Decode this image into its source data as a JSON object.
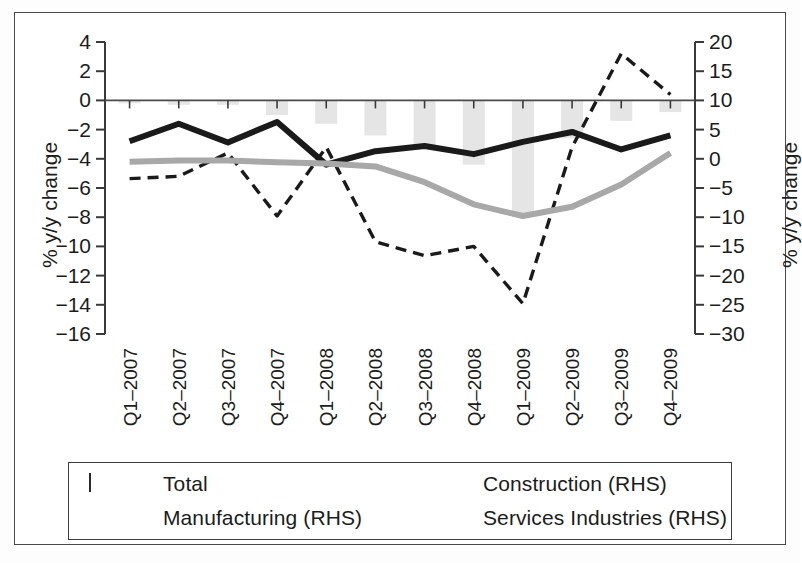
{
  "figure": {
    "left_axis_title": "% y/y change",
    "right_axis_title": "% y/y change"
  },
  "legend": {
    "entries": [
      {
        "label": "Total",
        "marker": "bar-swatch",
        "color": "#e2e2e2"
      },
      {
        "label": "Construction (RHS)",
        "marker": "solid-line",
        "color": "#1a1a1a"
      },
      {
        "label": "Manufacturing (RHS)",
        "marker": "dashed-line",
        "color": "#1a1a1a"
      },
      {
        "label": "Services Industries (RHS)",
        "marker": "gray-line",
        "color": "#a8a8a8"
      }
    ]
  },
  "chart_data": {
    "type": "line",
    "title": "",
    "xlabel": "",
    "ylabel": "% y/y change",
    "y2label": "% y/y change",
    "grid": false,
    "legend_position": "bottom",
    "categories": [
      "Q1-2007",
      "Q2-2007",
      "Q3-2007",
      "Q4-2007",
      "Q1-2008",
      "Q2-2008",
      "Q3-2008",
      "Q4-2008",
      "Q1-2009",
      "Q2-2009",
      "Q3-2009",
      "Q4-2009"
    ],
    "ylim": [
      -16,
      4
    ],
    "yticks": [
      4,
      2,
      0,
      -2,
      -4,
      -6,
      -8,
      -10,
      -12,
      -14,
      -16
    ],
    "ytick_labels": [
      "4",
      "2",
      "0",
      "-2",
      "-4",
      "-6",
      "-8",
      "-10",
      "-12",
      "-14",
      "-16"
    ],
    "y2lim": [
      -30,
      20
    ],
    "y2ticks": [
      20,
      15,
      10,
      5,
      0,
      -5,
      -10,
      -15,
      -20,
      -25,
      -30
    ],
    "y2tick_labels": [
      "20",
      "15",
      "10",
      "5",
      "0",
      "-5",
      "-10",
      "-15",
      "-20",
      "-25",
      "-30"
    ],
    "series": [
      {
        "name": "Total",
        "axis": "left",
        "type": "bar",
        "color": "#e5e5e5",
        "values": [
          -0.2,
          -0.3,
          -0.3,
          -1.0,
          -1.6,
          -2.4,
          -3.2,
          -4.4,
          -8.0,
          -2.6,
          -1.4,
          -0.8
        ]
      },
      {
        "name": "Construction (RHS)",
        "axis": "right",
        "type": "line",
        "style": "solid",
        "color": "#1a1a1a",
        "values": [
          3.0,
          6.0,
          2.8,
          6.3,
          -1.0,
          1.3,
          2.2,
          0.8,
          2.9,
          4.6,
          1.6,
          4.0
        ],
        "left_equivalent": [
          -2.1,
          -0.9,
          -2.3,
          -0.9,
          -5.8,
          -3.5,
          -2.9,
          -3.7,
          -2.1,
          -1.4,
          -3.4,
          -2.4
        ]
      },
      {
        "name": "Manufacturing (RHS)",
        "axis": "right",
        "type": "line",
        "style": "dashed",
        "color": "#1a1a1a",
        "values": [
          -3.4,
          -3.0,
          1.0,
          -9.8,
          2.0,
          -14.2,
          -16.6,
          -15.0,
          -24.8,
          2.0,
          18.0,
          11.0
        ],
        "left_equivalent": [
          -4.7,
          -4.5,
          -3.0,
          -7.9,
          -3.2,
          -9.7,
          -10.6,
          -10.0,
          -13.9,
          -3.2,
          3.2,
          0.4
        ]
      },
      {
        "name": "Services Industries (RHS)",
        "axis": "right",
        "type": "line",
        "style": "solid",
        "color": "#a8a8a8",
        "values": [
          -0.5,
          -0.3,
          -0.3,
          -0.6,
          -0.8,
          -1.3,
          -4.0,
          -7.8,
          -9.8,
          -8.2,
          -4.4,
          1.0
        ],
        "left_equivalent": [
          -3.8,
          -3.7,
          -3.7,
          -3.8,
          -3.9,
          -4.1,
          -5.2,
          -6.7,
          -7.5,
          -6.8,
          -5.2,
          -3.0
        ]
      }
    ]
  }
}
